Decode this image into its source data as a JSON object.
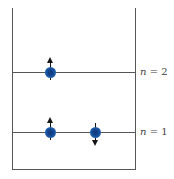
{
  "diagram": {
    "type": "energy-level-diagram",
    "colors": {
      "line": "#55575a",
      "label": "#3f3f3f",
      "electron_blue": "#1e5dab",
      "arrow": "#151515",
      "background": "#ffffff"
    },
    "levels": [
      {
        "n": 2,
        "label_var": "n",
        "label_eq": " = 2",
        "electrons": [
          {
            "spin": "up"
          }
        ]
      },
      {
        "n": 1,
        "label_var": "n",
        "label_eq": " = 1",
        "electrons": [
          {
            "spin": "up"
          },
          {
            "spin": "down"
          }
        ]
      }
    ]
  }
}
